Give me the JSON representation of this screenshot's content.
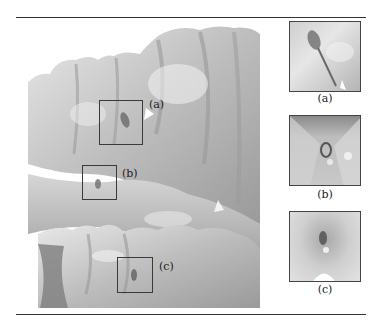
{
  "figure": {
    "main_view": {
      "regions": [
        {
          "id": "a",
          "label": "(a)",
          "box": {
            "x": 99,
            "y": 100,
            "w": 44,
            "h": 45
          },
          "label_pos": {
            "x": 149,
            "y": 99
          }
        },
        {
          "id": "b",
          "label": "(b)",
          "box": {
            "x": 82,
            "y": 165,
            "w": 35,
            "h": 35
          },
          "label_pos": {
            "x": 122,
            "y": 168
          }
        },
        {
          "id": "c",
          "label": "(c)",
          "box": {
            "x": 117,
            "y": 257,
            "w": 36,
            "h": 36
          },
          "label_pos": {
            "x": 159,
            "y": 261
          }
        }
      ]
    },
    "thumbnails": [
      {
        "id": "a",
        "label": "(a)"
      },
      {
        "id": "b",
        "label": "(b)"
      },
      {
        "id": "c",
        "label": "(c)"
      }
    ],
    "colors": {
      "surface_light": "#e4e4e4",
      "surface_mid": "#b8b8b8",
      "surface_dark": "#8a8a8a",
      "box_stroke": "#3a3a3a",
      "rule": "#333333"
    }
  }
}
